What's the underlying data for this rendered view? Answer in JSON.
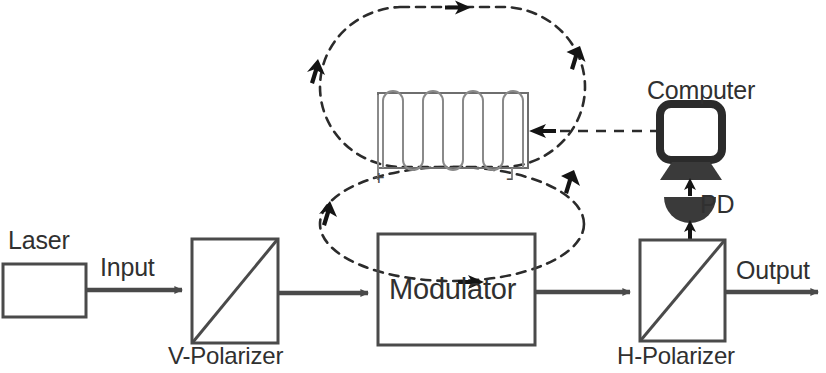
{
  "figure": {
    "kind": "optical-modulation-schematic",
    "background_color": "#ffffff",
    "line_color": "#4a4a4a",
    "dark_color": "#2b2b2b",
    "text_color": "#303030",
    "width": 826,
    "height": 373
  },
  "labels": {
    "laser": "Laser",
    "input": "Input",
    "v_polarizer": "V-Polarizer",
    "modulator": "Modulator",
    "h_polarizer": "H-Polarizer",
    "output": "Output",
    "computer": "Computer",
    "pd": "PD",
    "coil_positive": "+",
    "coil_negative": "-"
  },
  "components": [
    {
      "id": "laser",
      "type": "rect-box",
      "label": "Laser",
      "x": 3,
      "y": 264,
      "w": 83,
      "h": 53
    },
    {
      "id": "v-polarizer",
      "type": "box-with-diagonal",
      "label": "V-Polarizer",
      "x": 192,
      "y": 239,
      "w": 86,
      "h": 104
    },
    {
      "id": "modulator",
      "type": "rect-box",
      "label": "Modulator",
      "x": 378,
      "y": 234,
      "w": 157,
      "h": 111
    },
    {
      "id": "h-polarizer",
      "type": "box-with-diagonal",
      "label": "H-Polarizer",
      "x": 640,
      "y": 240,
      "w": 85,
      "h": 101
    },
    {
      "id": "solenoid",
      "type": "coil",
      "label": "",
      "x": 378,
      "y": 93,
      "w": 150,
      "h": 75,
      "turns": 5
    },
    {
      "id": "computer",
      "type": "monitor",
      "label": "Computer",
      "x": 660,
      "y": 104,
      "w": 62,
      "h": 56
    },
    {
      "id": "photodiode",
      "type": "dome",
      "label": "PD",
      "x": 665,
      "y": 188,
      "w": 52,
      "h": 26
    }
  ],
  "beam_path": {
    "description": "solid optical beam path, left to right",
    "segments": [
      {
        "from": "laser",
        "to": "v-polarizer",
        "label": "Input",
        "y": 290
      },
      {
        "from": "v-polarizer",
        "to": "modulator",
        "label": "",
        "y": 290
      },
      {
        "from": "modulator",
        "to": "h-polarizer",
        "label": "",
        "y": 290
      },
      {
        "from": "h-polarizer",
        "to": "exit",
        "label": "Output",
        "y": 290
      }
    ]
  },
  "signal_links": [
    {
      "id": "pd-to-computer",
      "style": "dashed",
      "direction": "up",
      "from": "photodiode",
      "to": "computer"
    },
    {
      "id": "hpol-to-pd",
      "style": "solid",
      "direction": "up",
      "from": "h-polarizer",
      "to": "photodiode"
    },
    {
      "id": "computer-to-coil",
      "style": "dashed",
      "direction": "left",
      "from": "computer",
      "to": "solenoid"
    }
  ],
  "field_loops": [
    {
      "id": "upper-field-loop",
      "style": "dashed",
      "shape": "stadium",
      "cx": 452,
      "cy": 90,
      "rx": 133,
      "ry": 83,
      "arrows": [
        "top-right",
        "right-down",
        "left-down"
      ]
    },
    {
      "id": "lower-field-loop",
      "style": "dashed",
      "shape": "ellipse",
      "cx": 452,
      "cy": 224,
      "rx": 132,
      "ry": 58,
      "arrows": [
        "bottom-right",
        "right-down",
        "left-down"
      ]
    }
  ]
}
